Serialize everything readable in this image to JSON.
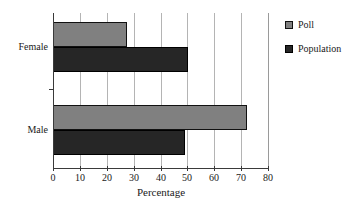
{
  "chart_data": {
    "type": "bar",
    "orientation": "horizontal",
    "title": "",
    "xlabel": "Percentage",
    "ylabel": "",
    "xlim": [
      0,
      80
    ],
    "xticks": [
      0,
      10,
      20,
      30,
      40,
      50,
      60,
      70,
      80
    ],
    "categories": [
      "Female",
      "Male"
    ],
    "grid": "vertical",
    "legend_position": "right",
    "series": [
      {
        "name": "Poll",
        "color": "#808080",
        "values": [
          27.5,
          72
        ]
      },
      {
        "name": "Population",
        "color": "#262626",
        "values": [
          50.2,
          49
        ]
      }
    ]
  },
  "legend": {
    "items": [
      {
        "label": "Poll",
        "swatch": "poll"
      },
      {
        "label": "Population",
        "swatch": "population"
      }
    ]
  }
}
